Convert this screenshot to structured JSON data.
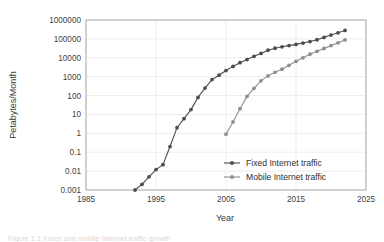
{
  "chart_data": {
    "type": "line",
    "title": "",
    "xlabel": "Year",
    "ylabel": "Petabytes/Month",
    "xlim": [
      1985,
      2025
    ],
    "ylim": [
      0.001,
      1000000
    ],
    "yscale": "log",
    "grid": true,
    "legend_position": "inside-lower-right",
    "xticks": [
      "1985",
      "1995",
      "2005",
      "2015",
      "2025"
    ],
    "xtick_values": [
      1985,
      1995,
      2005,
      2015,
      2025
    ],
    "yticks": [
      "0.001",
      "0.01",
      "0.1",
      "1",
      "10",
      "100",
      "1000",
      "10000",
      "100000",
      "1000000"
    ],
    "ytick_values": [
      0.001,
      0.01,
      0.1,
      1,
      10,
      100,
      1000,
      10000,
      100000,
      1000000
    ],
    "series": [
      {
        "name": "Fixed Internet traffic",
        "color": "#4d4d4d",
        "marker": "circle",
        "x": [
          1992,
          1993,
          1994,
          1995,
          1996,
          1997,
          1998,
          1999,
          2000,
          2001,
          2002,
          2003,
          2004,
          2005,
          2006,
          2007,
          2008,
          2009,
          2010,
          2011,
          2012,
          2013,
          2014,
          2015,
          2016,
          2017,
          2018,
          2019,
          2020,
          2021,
          2022
        ],
        "values": [
          0.001,
          0.002,
          0.005,
          0.012,
          0.022,
          0.2,
          2,
          6,
          18,
          80,
          250,
          700,
          1200,
          2100,
          3500,
          5500,
          8000,
          12000,
          17000,
          25000,
          32000,
          38000,
          44000,
          51000,
          60000,
          72000,
          90000,
          120000,
          160000,
          210000,
          280000
        ]
      },
      {
        "name": "Mobile Internet traffic",
        "color": "#8f8f8f",
        "marker": "circle",
        "x": [
          2005,
          2006,
          2007,
          2008,
          2009,
          2010,
          2011,
          2012,
          2013,
          2014,
          2015,
          2016,
          2017,
          2018,
          2019,
          2020,
          2021,
          2022
        ],
        "values": [
          0.9,
          4,
          20,
          90,
          240,
          600,
          1100,
          1700,
          2500,
          4000,
          6500,
          10000,
          15500,
          22000,
          31000,
          44000,
          62000,
          88000
        ]
      }
    ]
  },
  "legend": {
    "items": [
      {
        "label": "Fixed Internet traffic"
      },
      {
        "label": "Mobile Internet traffic"
      }
    ]
  },
  "caption": {
    "text": "Figure 1.1   Fixed and mobile Internet traffic growth"
  }
}
